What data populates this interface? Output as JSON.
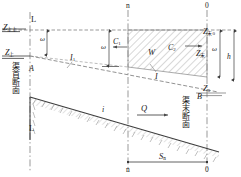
{
  "figure": {
    "type": "engineering-longitudinal-profile",
    "stroke_color": "#3a3a3a",
    "dash_color": "#6d6d6d",
    "hatch_color": "#8a8a8a"
  },
  "stations": {
    "top_left_section": "n",
    "top_right_section": "0",
    "bottom_left_section": "n",
    "bottom_right_section": "0"
  },
  "labels": {
    "head_section_cn": "渠首断面",
    "tail_section_cn": "渠末断面",
    "point_A": "A",
    "point_B": "B",
    "datum_upper_left": "L",
    "datum_lower_left": "L",
    "water_level_head_upper": "Z",
    "water_level_head_upper_sub": "上上",
    "water_level_head_lower": "Z",
    "water_level_head_lower_sub": "上",
    "water_level_tail_upper": "Z",
    "water_level_tail_upper_sub": "末0",
    "water_level_tail_mid": "Z",
    "water_level_tail_mid_sub": "末",
    "water_level_tail_bed": "Z",
    "water_level_tail_bed_sub": "0",
    "area_head": "ω",
    "area_mid": "ω",
    "area_tail": "ω",
    "depth_tail": "h",
    "slope_initial": "I",
    "slope_initial_sub": "1",
    "slope_final": "I",
    "celerity_left": "C",
    "celerity_left_sub": "1",
    "celerity_right": "C",
    "celerity_right_sub": "2",
    "storage_volume": "W",
    "bed_slope": "i",
    "discharge": "Q",
    "distance": "S",
    "distance_sub": "n"
  },
  "geometry": {
    "canvas_width": 241,
    "canvas_height": 177,
    "section_x_left": 30,
    "section_x_mid": 128,
    "section_x_right": 207,
    "upper_water_y_left": 30,
    "upper_water_y_right": 44,
    "lower_water_y_left": 55,
    "lower_water_y_right": 88,
    "bed_y_left": 97,
    "bed_y_right": 152
  }
}
